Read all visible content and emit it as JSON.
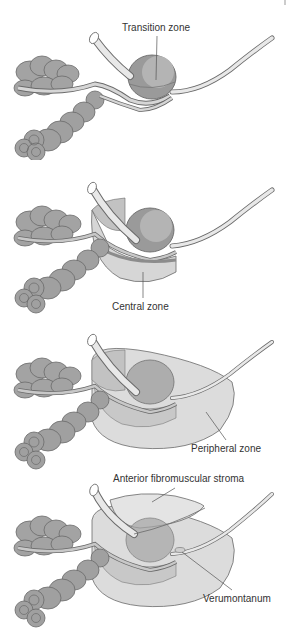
{
  "figure": {
    "panels": [
      {
        "id": "transition",
        "label": "Transition zone"
      },
      {
        "id": "central",
        "label": "Central zone"
      },
      {
        "id": "peripheral",
        "label": "Peripheral zone"
      },
      {
        "id": "full",
        "labels": [
          "Anterior fibromuscular stroma",
          "Verumontanum"
        ]
      }
    ]
  },
  "colors": {
    "seminal_vesicle": "#9a9a9a",
    "gland_dark": "#8c8c8c",
    "gland_mid": "#b5b5b5",
    "gland_light": "#d6d6d6",
    "urethra": "#e8e8e8",
    "outline": "#6a6a6a",
    "leader_line": "#555555",
    "text": "#333333"
  }
}
